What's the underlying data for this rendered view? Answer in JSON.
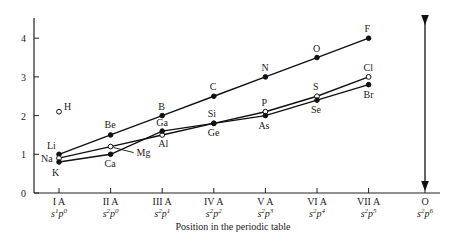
{
  "chart_data": {
    "type": "line",
    "title": "",
    "xlabel": "Position in the periodic table",
    "ylabel": "",
    "ylim": [
      0,
      4.5
    ],
    "yticks": [
      0,
      1,
      2,
      3,
      4
    ],
    "grid": false,
    "legend": "none (points labeled directly)",
    "categories": [
      {
        "group": "I A",
        "config": "s1p0",
        "base": "s",
        "sup1": "1",
        "p": "p",
        "sup2": "0"
      },
      {
        "group": "II A",
        "config": "s2p0",
        "base": "s",
        "sup1": "2",
        "p": "p",
        "sup2": "0"
      },
      {
        "group": "III A",
        "config": "s2p1",
        "base": "s",
        "sup1": "2",
        "p": "p",
        "sup2": "1"
      },
      {
        "group": "IV A",
        "config": "s2p2",
        "base": "s",
        "sup1": "2",
        "p": "p",
        "sup2": "2"
      },
      {
        "group": "V A",
        "config": "s2p3",
        "base": "s",
        "sup1": "2",
        "p": "p",
        "sup2": "3"
      },
      {
        "group": "VI A",
        "config": "s2p4",
        "base": "s",
        "sup1": "2",
        "p": "p",
        "sup2": "4"
      },
      {
        "group": "VII A",
        "config": "s2p5",
        "base": "s",
        "sup1": "2",
        "p": "p",
        "sup2": "5"
      },
      {
        "group": "O",
        "config": "s2p6",
        "base": "s",
        "sup1": "2",
        "p": "p",
        "sup2": "6"
      }
    ],
    "series": [
      {
        "name": "Period 2",
        "marker": "filled",
        "points": [
          {
            "el": "Li",
            "x": 0,
            "y": 1.0,
            "lx": -12,
            "ly": -5
          },
          {
            "el": "Be",
            "x": 1,
            "y": 1.5,
            "lx": -6,
            "ly": -7
          },
          {
            "el": "B",
            "x": 2,
            "y": 2.0,
            "lx": -4,
            "ly": -6
          },
          {
            "el": "C",
            "x": 3,
            "y": 2.5,
            "lx": -4,
            "ly": -6
          },
          {
            "el": "N",
            "x": 4,
            "y": 3.0,
            "lx": -4,
            "ly": -6
          },
          {
            "el": "O",
            "x": 5,
            "y": 3.5,
            "lx": -4,
            "ly": -6
          },
          {
            "el": "F",
            "x": 6,
            "y": 4.0,
            "lx": -4,
            "ly": -6
          }
        ]
      },
      {
        "name": "Period 3",
        "marker": "open",
        "points": [
          {
            "el": "Na",
            "x": 0,
            "y": 0.9,
            "lx": -18,
            "ly": 4
          },
          {
            "el": "Mg",
            "x": 1,
            "y": 1.2,
            "lx": 26,
            "ly": 9,
            "leader": true
          },
          {
            "el": "Al",
            "x": 2,
            "y": 1.5,
            "lx": -4,
            "ly": 12
          },
          {
            "el": "Si",
            "x": 3,
            "y": 1.8,
            "lx": -6,
            "ly": -6
          },
          {
            "el": "P",
            "x": 4,
            "y": 2.1,
            "lx": -4,
            "ly": -6
          },
          {
            "el": "S",
            "x": 5,
            "y": 2.5,
            "lx": -4,
            "ly": -6
          },
          {
            "el": "Cl",
            "x": 6,
            "y": 3.0,
            "lx": -5,
            "ly": -6
          }
        ]
      },
      {
        "name": "Period 4",
        "marker": "filled",
        "points": [
          {
            "el": "K",
            "x": 0,
            "y": 0.8,
            "lx": -7,
            "ly": 14
          },
          {
            "el": "Ca",
            "x": 1,
            "y": 1.0,
            "lx": -6,
            "ly": 13
          },
          {
            "el": "Ga",
            "x": 2,
            "y": 1.6,
            "lx": -6,
            "ly": -5
          },
          {
            "el": "Ge",
            "x": 3,
            "y": 1.8,
            "lx": -6,
            "ly": 13
          },
          {
            "el": "As",
            "x": 4,
            "y": 2.0,
            "lx": -7,
            "ly": 13
          },
          {
            "el": "Se",
            "x": 5,
            "y": 2.4,
            "lx": -6,
            "ly": 13
          },
          {
            "el": "Br",
            "x": 6,
            "y": 2.8,
            "lx": -5,
            "ly": 13
          }
        ]
      },
      {
        "name": "H",
        "marker": "open",
        "points": [
          {
            "el": "H",
            "x": 0,
            "y": 2.1,
            "lx": 5,
            "ly": -2
          }
        ]
      }
    ],
    "annotations": [
      "Double-headed vertical arrow above group O (s2p6) spanning full y-range"
    ]
  },
  "axis": {
    "x_title": "Position in the periodic table"
  }
}
